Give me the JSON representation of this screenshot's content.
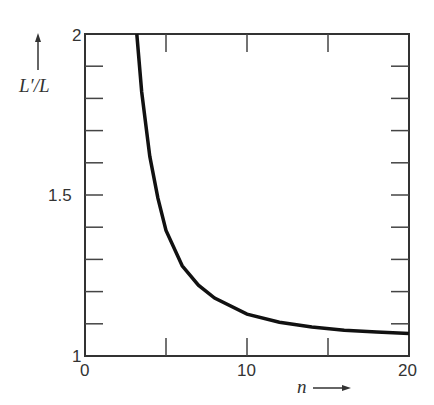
{
  "chart_data": {
    "type": "line",
    "title": "",
    "xlabel": "n",
    "ylabel": "L'/L",
    "xlim": [
      0,
      20
    ],
    "ylim": [
      1,
      2
    ],
    "x_ticks": [
      "0",
      "10",
      "20"
    ],
    "y_ticks": [
      "1",
      "1.5",
      "2"
    ],
    "grid": false,
    "series": [
      {
        "name": "L'/L",
        "x": [
          3.2,
          3.5,
          4,
          4.5,
          5,
          6,
          7,
          8,
          10,
          12,
          14,
          16,
          18,
          20
        ],
        "values": [
          2.0,
          1.82,
          1.62,
          1.49,
          1.39,
          1.28,
          1.22,
          1.18,
          1.13,
          1.105,
          1.09,
          1.08,
          1.075,
          1.07
        ]
      }
    ]
  },
  "labels": {
    "y_axis": "L′/L",
    "x_axis": "n",
    "y1": "1",
    "y15": "1.5",
    "y2": "2",
    "x0": "0",
    "x10": "10",
    "x20": "20"
  }
}
